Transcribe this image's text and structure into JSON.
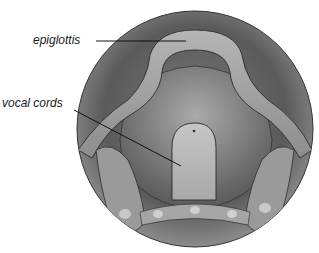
{
  "diagram": {
    "labels": [
      {
        "id": "epiglottis",
        "text": "epiglottis",
        "x": 33,
        "y": 34,
        "line": {
          "x1": 96,
          "y1": 41,
          "x2": 186,
          "y2": 41
        }
      },
      {
        "id": "vocal-cords",
        "text": "vocal cords",
        "x": 2,
        "y": 98,
        "line": {
          "x1": 74,
          "y1": 110,
          "x2": 181,
          "y2": 166
        }
      }
    ],
    "colors": {
      "background": "#ffffff",
      "outer_ring": "#6a6a6a",
      "tissue_dark": "#4d4d4d",
      "tissue_mid": "#8a8a8a",
      "tissue_light": "#bdbdbd",
      "leader_line": "#111111"
    }
  }
}
